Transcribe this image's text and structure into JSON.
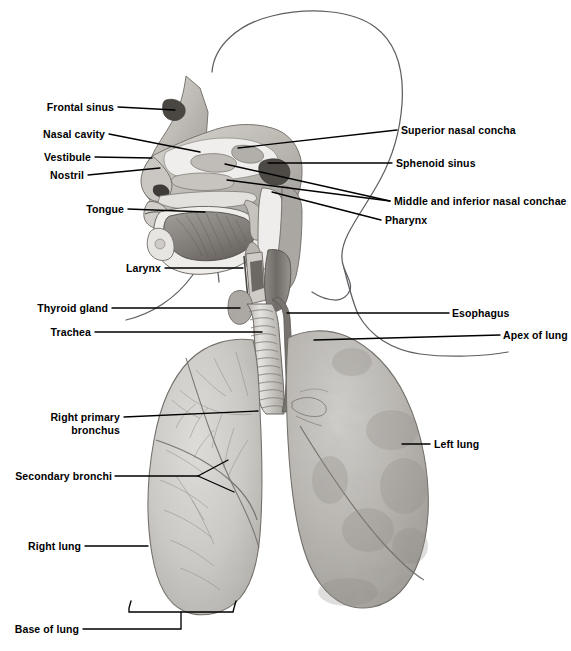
{
  "figure": {
    "background_color": "#ffffff",
    "ink_color": "#000000",
    "outline_color": "#55565a",
    "tissue_light": "#d8d6d2",
    "tissue_mid": "#b4b1ac",
    "tissue_dark": "#85817c",
    "lung_left_tone": "#b9b7b3",
    "lung_right_tone": "#c9c7c3"
  },
  "labels": {
    "frontal_sinus": "Frontal sinus",
    "nasal_cavity": "Nasal cavity",
    "vestibule": "Vestibule",
    "nostril": "Nostril",
    "tongue": "Tongue",
    "larynx": "Larynx",
    "thyroid_gland": "Thyroid gland",
    "trachea": "Trachea",
    "right_primary_bronchus_line1": "Right primary",
    "right_primary_bronchus_line2": "bronchus",
    "secondary_bronchi": "Secondary bronchi",
    "right_lung": "Right lung",
    "base_of_lung": "Base of lung",
    "superior_nasal_concha": "Superior nasal concha",
    "sphenoid_sinus": "Sphenoid sinus",
    "middle_and_inferior_nasal_conchae": "Middle and inferior nasal conchae",
    "pharynx": "Pharynx",
    "esophagus": "Esophagus",
    "apex_of_lung": "Apex of lung",
    "left_lung": "Left lung"
  },
  "label_list": [
    {
      "key": "frontal_sinus",
      "text": "Frontal sinus",
      "side": "left"
    },
    {
      "key": "nasal_cavity",
      "text": "Nasal cavity",
      "side": "left"
    },
    {
      "key": "vestibule",
      "text": "Vestibule",
      "side": "left"
    },
    {
      "key": "nostril",
      "text": "Nostril",
      "side": "left"
    },
    {
      "key": "tongue",
      "text": "Tongue",
      "side": "left"
    },
    {
      "key": "larynx",
      "text": "Larynx",
      "side": "left"
    },
    {
      "key": "thyroid_gland",
      "text": "Thyroid gland",
      "side": "left"
    },
    {
      "key": "trachea",
      "text": "Trachea",
      "side": "left"
    },
    {
      "key": "right_primary_bronchus",
      "text": "Right primary bronchus",
      "side": "left"
    },
    {
      "key": "secondary_bronchi",
      "text": "Secondary bronchi",
      "side": "left"
    },
    {
      "key": "right_lung",
      "text": "Right lung",
      "side": "left"
    },
    {
      "key": "base_of_lung",
      "text": "Base of lung",
      "side": "left"
    },
    {
      "key": "superior_nasal_concha",
      "text": "Superior nasal concha",
      "side": "right"
    },
    {
      "key": "sphenoid_sinus",
      "text": "Sphenoid sinus",
      "side": "right"
    },
    {
      "key": "middle_and_inferior_nasal_conchae",
      "text": "Middle and inferior nasal conchae",
      "side": "right"
    },
    {
      "key": "pharynx",
      "text": "Pharynx",
      "side": "right"
    },
    {
      "key": "esophagus",
      "text": "Esophagus",
      "side": "right"
    },
    {
      "key": "apex_of_lung",
      "text": "Apex of lung",
      "side": "right"
    },
    {
      "key": "left_lung",
      "text": "Left lung",
      "side": "right"
    }
  ]
}
